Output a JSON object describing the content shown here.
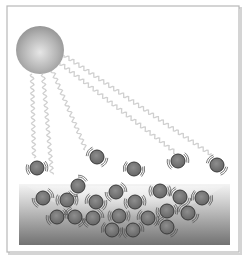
{
  "diagram": {
    "colors": {
      "frame": "#b8b8b8",
      "frame_shadow": "#d4d4d4",
      "sun_light": "#e2e2e2",
      "sun_dark": "#8c8c8c",
      "ray": "#d0d0d0",
      "molecule_fill": "#7a7a7a",
      "molecule_stroke": "#3a3a3a",
      "motion_lines": "#555555",
      "liquid_top": "#f2f2f2",
      "liquid_bottom": "#6e6e6e"
    },
    "sun": {
      "cx": 40,
      "cy": 50,
      "r": 24
    },
    "rays": [
      {
        "x1": 32,
        "y1": 74,
        "x2": 34,
        "y2": 158
      },
      {
        "x1": 43,
        "y1": 74,
        "x2": 52,
        "y2": 175
      },
      {
        "x1": 52,
        "y1": 70,
        "x2": 86,
        "y2": 150
      },
      {
        "x1": 60,
        "y1": 63,
        "x2": 176,
        "y2": 153
      },
      {
        "x1": 64,
        "y1": 55,
        "x2": 212,
        "y2": 155
      }
    ],
    "liquid": {
      "x": 19,
      "y": 184,
      "width": 211,
      "height": 61
    },
    "molecules": {
      "gas": [
        {
          "cx": 37,
          "cy": 168
        },
        {
          "cx": 97,
          "cy": 157
        },
        {
          "cx": 134,
          "cy": 169
        },
        {
          "cx": 178,
          "cy": 161
        },
        {
          "cx": 217,
          "cy": 165
        }
      ],
      "escaping": [
        {
          "cx": 78,
          "cy": 186
        },
        {
          "cx": 116,
          "cy": 192
        },
        {
          "cx": 160,
          "cy": 191
        }
      ],
      "liquid": [
        {
          "cx": 43,
          "cy": 198
        },
        {
          "cx": 67,
          "cy": 200
        },
        {
          "cx": 96,
          "cy": 202
        },
        {
          "cx": 135,
          "cy": 202
        },
        {
          "cx": 180,
          "cy": 197
        },
        {
          "cx": 202,
          "cy": 198
        },
        {
          "cx": 57,
          "cy": 217
        },
        {
          "cx": 75,
          "cy": 217
        },
        {
          "cx": 93,
          "cy": 218
        },
        {
          "cx": 119,
          "cy": 216
        },
        {
          "cx": 148,
          "cy": 218
        },
        {
          "cx": 167,
          "cy": 211
        },
        {
          "cx": 188,
          "cy": 213
        },
        {
          "cx": 112,
          "cy": 230
        },
        {
          "cx": 133,
          "cy": 230
        },
        {
          "cx": 167,
          "cy": 227
        }
      ]
    },
    "molecule_radius": 7
  }
}
